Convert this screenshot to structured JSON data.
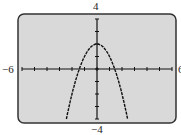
{
  "labels": {
    "top": "4",
    "bottom": "−4",
    "left": "−6",
    "right": "6"
  },
  "chart_data": {
    "type": "line",
    "title": "",
    "function": "y = 2 - x^2",
    "xlim": [
      -6,
      6
    ],
    "ylim": [
      -4,
      4
    ],
    "x_tick_spacing": 1,
    "y_tick_spacing": 1,
    "grid": false,
    "series": [
      {
        "name": "y = 2 - x^2",
        "x": [
          -2.45,
          -2,
          -1.5,
          -1,
          -0.5,
          0,
          0.5,
          1,
          1.5,
          2,
          2.45
        ],
        "y": [
          -4,
          -2,
          -0.25,
          1,
          1.75,
          2,
          1.75,
          1,
          -0.25,
          -2,
          -4
        ]
      }
    ],
    "window_labels": {
      "xmin": "-6",
      "xmax": "6",
      "ymin": "-4",
      "ymax": "4"
    },
    "colors": {
      "screen": "#d9d9d9",
      "frame": "#333333",
      "curve": "#111111"
    }
  }
}
